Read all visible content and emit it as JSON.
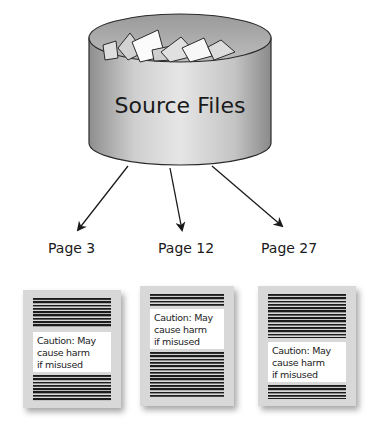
{
  "diagram": {
    "source": {
      "label": "Source Files",
      "icon": "database-cylinder-with-documents"
    },
    "pages": [
      {
        "label": "Page 3",
        "caution_lines": [
          "Caution: May",
          "cause harm",
          "if misused"
        ],
        "caution_position": "middle"
      },
      {
        "label": "Page 12",
        "caution_lines": [
          "Caution: May",
          "cause harm",
          "if misused"
        ],
        "caution_position": "top"
      },
      {
        "label": "Page 27",
        "caution_lines": [
          "Caution: May",
          "cause harm",
          "if misused"
        ],
        "caution_position": "lower"
      }
    ],
    "colors": {
      "cylinder_body": "#c8c8c8",
      "page_bg": "#d8d8d8",
      "text_lines": "#1c1c1c",
      "caution_bg": "#ffffff"
    }
  }
}
